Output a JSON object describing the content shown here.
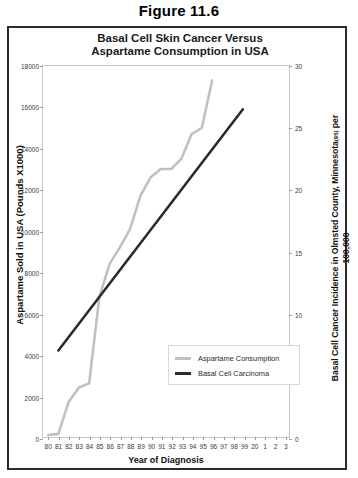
{
  "figure": {
    "caption": "Figure 11.6"
  },
  "chart_data": {
    "type": "line",
    "title": "Basal Cell Skin Cancer Versus Aspartame Consumption  in USA",
    "title_line1": "Basal Cell Skin Cancer Versus",
    "title_line2": "Aspartame Consumption  in USA",
    "xlabel": "Year of Diagnosis",
    "ylabel": "Aspartame Sold in USA  (Pounds X1000)",
    "ylabel_right": "Basal Cell Cancer Incidence in Olmsted County, Minnesota (95) per 100,000",
    "ylabel_right_main": "Basal Cell Cancer Incidence in Olmsted County, Minnesota",
    "ylabel_right_sup": "(95)",
    "ylabel_right_tail": " per",
    "ylabel_right_line2": "100,000",
    "grid": false,
    "legend_position": "lower-right-inside",
    "x": [
      "80",
      "81",
      "82",
      "83",
      "84",
      "85",
      "86",
      "87",
      "88",
      "89",
      "90",
      "91",
      "92",
      "93",
      "94",
      "95",
      "96",
      "97",
      "98",
      "99",
      "20",
      "1",
      "2",
      "3"
    ],
    "xtick_labels": [
      "80",
      "81",
      "82",
      "83",
      "84",
      "85",
      "86",
      "87",
      "88",
      "89",
      "90",
      "91",
      "92",
      "93",
      "94",
      "95",
      "96",
      "97",
      "98",
      "99",
      "20",
      "1",
      "2",
      "3"
    ],
    "ylim": [
      0,
      18000
    ],
    "ytick_labels": [
      "0",
      "2000",
      "4000",
      "6000",
      "8000",
      "10000",
      "12000",
      "14000",
      "16000",
      "18000"
    ],
    "ytick_values": [
      0,
      2000,
      4000,
      6000,
      8000,
      10000,
      12000,
      14000,
      16000,
      18000
    ],
    "ylim_right": [
      0,
      30
    ],
    "ytick_labels_right": [
      "0",
      "5",
      "10",
      "15",
      "20",
      "25",
      "30"
    ],
    "ytick_values_right": [
      0,
      5,
      10,
      15,
      20,
      25,
      30
    ],
    "series": [
      {
        "name": "Aspartame Consumption",
        "color": "#c0c0c0",
        "axis": "left",
        "x": [
          "80",
          "81",
          "82",
          "83",
          "84",
          "85",
          "86",
          "87",
          "88",
          "89",
          "90",
          "91",
          "92",
          "93",
          "94",
          "95",
          "96"
        ],
        "values": [
          100,
          150,
          1700,
          2400,
          2600,
          6800,
          8400,
          9200,
          10100,
          11700,
          12600,
          13000,
          13000,
          13500,
          14700,
          15000,
          17300
        ]
      },
      {
        "name": "Basal Cell Carcinoma",
        "color": "#2b2b2b",
        "axis": "right",
        "x": [
          "81",
          "99"
        ],
        "values": [
          7.0,
          26.5
        ]
      }
    ],
    "legend": [
      {
        "label": "Aspartame Consumption",
        "color": "#c0c0c0"
      },
      {
        "label": "Basal Cell Carcinoma",
        "color": "#2b2b2b"
      }
    ]
  }
}
